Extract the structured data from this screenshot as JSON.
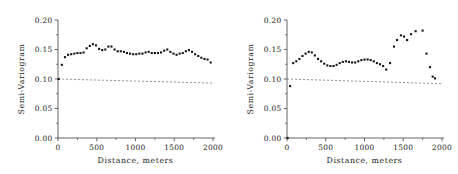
{
  "figure": {
    "background": "#ffffff",
    "panel_count": 2
  },
  "axis_text": {
    "ylabel": "Semi-Variogram",
    "xlabel": "Distance, meters",
    "ytick_labels": [
      "0.00",
      "0.05",
      "0.10",
      "0.15",
      "0.20"
    ],
    "xtick_labels": [
      "0",
      "500",
      "1000",
      "1500",
      "2000"
    ]
  },
  "chart_data": [
    {
      "type": "scatter",
      "panel": "left",
      "title": "",
      "xlabel": "Distance, meters",
      "ylabel": "Semi-Variogram",
      "xlim": [
        0,
        2000
      ],
      "ylim": [
        0.0,
        0.2
      ],
      "xticks": [
        0,
        500,
        1000,
        1500,
        2000
      ],
      "yticks": [
        0.0,
        0.05,
        0.1,
        0.15,
        0.2
      ],
      "grid": false,
      "legend": "none",
      "marker_color": "#141414",
      "model_line": {
        "style": "dashed",
        "color": "#7d7d7d",
        "x": [
          0,
          2000
        ],
        "y": [
          0.1,
          0.093
        ],
        "label": "nugget/reference level"
      },
      "x": [
        10,
        50,
        90,
        130,
        170,
        210,
        250,
        290,
        330,
        370,
        410,
        450,
        490,
        530,
        570,
        610,
        650,
        690,
        730,
        770,
        810,
        850,
        890,
        930,
        970,
        1010,
        1050,
        1090,
        1130,
        1170,
        1210,
        1250,
        1290,
        1330,
        1370,
        1410,
        1450,
        1490,
        1530,
        1570,
        1610,
        1650,
        1690,
        1730,
        1770,
        1810,
        1850,
        1890,
        1930,
        1970
      ],
      "y": [
        0.1,
        0.124,
        0.137,
        0.141,
        0.142,
        0.143,
        0.144,
        0.144,
        0.145,
        0.152,
        0.156,
        0.159,
        0.157,
        0.151,
        0.149,
        0.15,
        0.155,
        0.155,
        0.15,
        0.147,
        0.147,
        0.146,
        0.144,
        0.143,
        0.142,
        0.142,
        0.143,
        0.143,
        0.145,
        0.146,
        0.144,
        0.144,
        0.144,
        0.145,
        0.148,
        0.15,
        0.146,
        0.143,
        0.141,
        0.143,
        0.144,
        0.147,
        0.149,
        0.146,
        0.142,
        0.139,
        0.136,
        0.134,
        0.133,
        0.128
      ]
    },
    {
      "type": "scatter",
      "panel": "right",
      "title": "",
      "xlabel": "Distance, meters",
      "ylabel": "Semi-Variogram",
      "xlim": [
        0,
        2000
      ],
      "ylim": [
        0.0,
        0.2
      ],
      "xticks": [
        0,
        500,
        1000,
        1500,
        2000
      ],
      "yticks": [
        0.0,
        0.05,
        0.1,
        0.15,
        0.2
      ],
      "grid": false,
      "legend": "none",
      "marker_color": "#141414",
      "model_line": {
        "style": "dashed",
        "color": "#7d7d7d",
        "x": [
          0,
          2000
        ],
        "y": [
          0.1,
          0.092
        ],
        "label": "nugget/reference level"
      },
      "x": [
        8,
        40,
        80,
        120,
        160,
        200,
        240,
        280,
        320,
        360,
        400,
        440,
        480,
        520,
        560,
        600,
        640,
        680,
        720,
        760,
        800,
        840,
        880,
        920,
        960,
        1000,
        1040,
        1080,
        1120,
        1160,
        1200,
        1240,
        1280,
        1330,
        1380,
        1420,
        1470,
        1510,
        1550,
        1600,
        1660,
        1750,
        1800,
        1845,
        1880,
        1910
      ],
      "y": [
        0.0,
        0.088,
        0.127,
        0.13,
        0.134,
        0.139,
        0.143,
        0.146,
        0.145,
        0.14,
        0.134,
        0.13,
        0.126,
        0.123,
        0.122,
        0.122,
        0.124,
        0.127,
        0.129,
        0.13,
        0.129,
        0.128,
        0.128,
        0.13,
        0.132,
        0.133,
        0.133,
        0.132,
        0.13,
        0.127,
        0.125,
        0.122,
        0.116,
        0.127,
        0.155,
        0.166,
        0.174,
        0.172,
        0.166,
        0.176,
        0.181,
        0.182,
        0.143,
        0.12,
        0.104,
        0.101
      ]
    }
  ]
}
